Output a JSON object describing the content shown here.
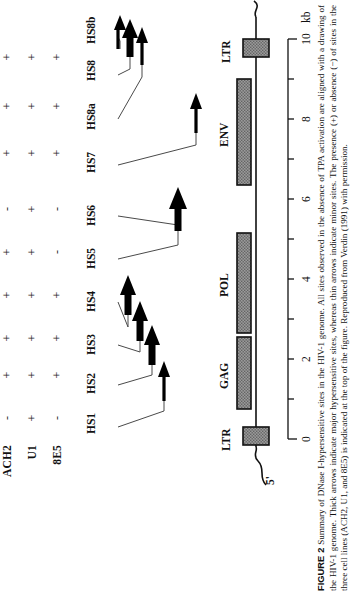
{
  "figure": {
    "number_label": "FIGURE 2",
    "caption": "Summary of DNase I-hypersensitive sites in the HIV-1 genome. All sites observed in the absence of TPA activation are aligned with a drawing of the HIV-1 genome. Thick arrows indicate major hypersensitive sites, whereas thin arrows indicate minor sites. The presence (+) or absence (−) of sites in the three cell lines (ACH2, U1, and 8E5) is indicated at the top of the figure. Reproduced from Verdin (1991) with permission."
  },
  "matrix": {
    "rows": [
      {
        "label": "ACH2",
        "signs": [
          "-",
          "+",
          "+",
          "+",
          "+",
          "-",
          "+",
          "+",
          "+"
        ]
      },
      {
        "label": "U1",
        "signs": [
          "+",
          "+",
          "+",
          "+",
          "+",
          "+",
          "+",
          "+",
          "+"
        ]
      },
      {
        "label": "8E5",
        "signs": [
          "-",
          "+",
          "+",
          "+",
          "-",
          "-",
          "+",
          "+",
          "+"
        ]
      }
    ]
  },
  "sites": {
    "labels": [
      "HS1",
      "HS2",
      "HS3",
      "HS4",
      "HS5",
      "HS6",
      "HS7",
      "HS8a",
      "HS8",
      "HS8b"
    ],
    "arrows": [
      {
        "name": "HS1",
        "weight": "thin"
      },
      {
        "name": "HS2",
        "weight": "thick"
      },
      {
        "name": "HS3",
        "weight": "thick"
      },
      {
        "name": "HS4",
        "weight": "thick"
      },
      {
        "name": "HS5-HS6",
        "weight": "thick"
      },
      {
        "name": "HS7",
        "weight": "thin"
      },
      {
        "name": "HS8a",
        "weight": "thin"
      },
      {
        "name": "HS8",
        "weight": "thick"
      },
      {
        "name": "HS8b",
        "weight": "thin"
      }
    ]
  },
  "genome": {
    "five_prime_label": "5'",
    "genes": [
      {
        "label": "LTR"
      },
      {
        "label": "GAG"
      },
      {
        "label": "POL"
      },
      {
        "label": "ENV"
      },
      {
        "label": "LTR"
      }
    ]
  },
  "scale": {
    "unit_label": "kb",
    "tick_labels": [
      "0",
      "2",
      "4",
      "6",
      "8",
      "10"
    ]
  },
  "colors": {
    "ink": "#111111",
    "gene_fill": "#8d8d8d",
    "arrow": "#000000"
  }
}
